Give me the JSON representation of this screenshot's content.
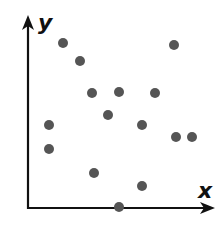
{
  "chart_data": {
    "type": "scatter",
    "title": "",
    "xlabel": "x",
    "ylabel": "y",
    "grid": false,
    "legend": null,
    "xlim": [
      0,
      10
    ],
    "ylim": [
      0,
      10
    ],
    "points_px": [
      [
        63,
        43
      ],
      [
        80,
        61
      ],
      [
        92,
        93
      ],
      [
        119,
        92
      ],
      [
        108,
        115
      ],
      [
        155,
        93
      ],
      [
        174,
        45
      ],
      [
        49,
        125
      ],
      [
        49,
        149
      ],
      [
        142,
        125
      ],
      [
        176,
        137
      ],
      [
        192,
        137
      ],
      [
        94,
        173
      ],
      [
        142,
        186
      ],
      [
        119,
        207
      ]
    ],
    "x": [
      1.9,
      2.8,
      3.5,
      5.0,
      4.4,
      6.9,
      8.0,
      1.1,
      1.1,
      6.2,
      8.1,
      9.0,
      3.6,
      6.2,
      5.0
    ],
    "y": [
      8.8,
      7.8,
      6.1,
      6.1,
      4.9,
      6.1,
      8.7,
      4.4,
      3.1,
      4.4,
      3.8,
      3.8,
      1.9,
      1.2,
      0.0
    ],
    "point_color": "#555555",
    "axis_color": "#111111"
  },
  "labels": {
    "x": "x",
    "y": "y"
  }
}
